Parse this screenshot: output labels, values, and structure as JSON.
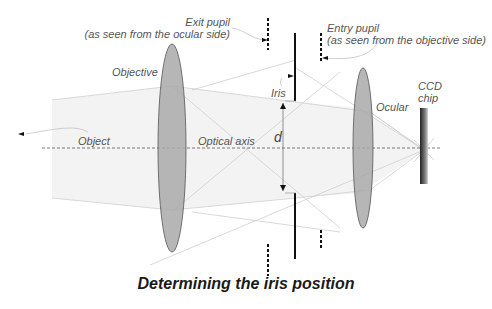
{
  "title": "Determining the iris position",
  "labels": {
    "exit_pupil_line1": "Exit pupil",
    "exit_pupil_line2": "(as seen from the ocular side)",
    "entry_pupil_line1": "Entry pupil",
    "entry_pupil_line2": "(as seen from the objective side)",
    "objective": "Objective",
    "iris": "Iris",
    "ocular": "Ocular",
    "ccd_line1": "CCD",
    "ccd_line2": "chip",
    "object": "Object",
    "optical_axis": "Optical axis",
    "d": "d"
  },
  "colors": {
    "lens_fill": "#a8a8a8",
    "lens_stroke": "#555555",
    "beam_fill": "#f2f2f2",
    "ray": "#c8c8c8",
    "axis": "#555555",
    "iris": "#111111",
    "text": "#555555",
    "caption": "#1a1a1a"
  }
}
